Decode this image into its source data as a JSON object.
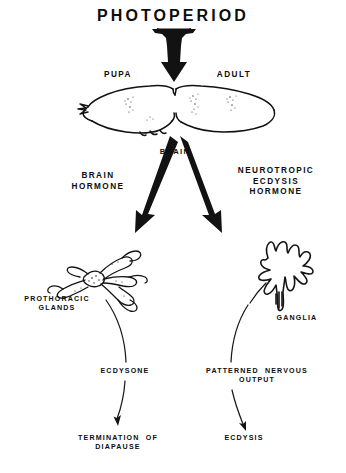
{
  "diagram": {
    "title": "PHOTOPERIOD",
    "background_color": "#ffffff",
    "ink_color": "#0d0d0d",
    "stage_labels": {
      "left": "PUPA",
      "right": "ADULT"
    },
    "organs": {
      "brain": "BRAIN",
      "prothoracic_glands": "PROTHORACIC\nGLANDS",
      "ganglia": "GANGLIA"
    },
    "hormones": {
      "left": "BRAIN\nHORMONE",
      "right": "NEUROTROPIC\nECDYSIS\nHORMONE",
      "left_secondary": "ECDYSONE",
      "right_secondary": "PATTERNED  NERVOUS\nOUTPUT"
    },
    "outcomes": {
      "left": "TERMINATION  OF\nDIAPAUSE",
      "right": "ECDYSIS"
    }
  }
}
